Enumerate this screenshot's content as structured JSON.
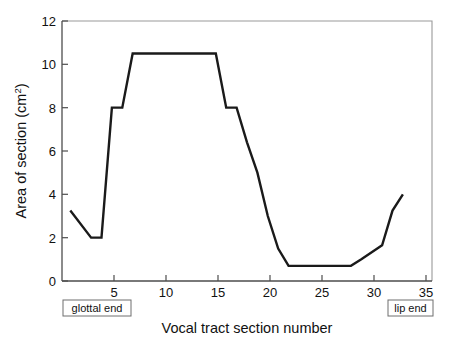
{
  "chart_data": {
    "type": "line",
    "title": "",
    "xlabel": "Vocal tract section number",
    "ylabel": "Area of section (cm",
    "ylabel_superscript": "2",
    "ylabel_suffix": ")",
    "xlim": [
      0.2,
      35.8
    ],
    "ylim": [
      0,
      12
    ],
    "xticks": [
      5,
      10,
      15,
      20,
      25,
      30,
      35
    ],
    "xtick_labels": [
      "5",
      "10",
      "15",
      "20",
      "25",
      "30",
      "35"
    ],
    "yticks": [
      0,
      2,
      4,
      6,
      8,
      10,
      12
    ],
    "ytick_labels": [
      "0",
      "2",
      "4",
      "6",
      "8",
      "10",
      "12"
    ],
    "grid": false,
    "legend": null,
    "series": [
      {
        "name": "area function",
        "color": "#1a1a1a",
        "x": [
          1,
          3,
          4,
          5,
          6,
          7,
          15,
          16,
          17,
          18,
          19,
          20,
          21,
          22,
          28,
          29,
          31,
          32,
          33
        ],
        "values": [
          3.25,
          2.0,
          2.0,
          8.0,
          8.0,
          10.5,
          10.5,
          8.0,
          8.0,
          6.4,
          5.0,
          3.0,
          1.5,
          0.7,
          0.7,
          1.0,
          1.65,
          3.25,
          4.0
        ]
      }
    ],
    "annotations": [
      {
        "name": "glottal-end",
        "text": "glottal end",
        "x_position": "left",
        "boxed": true
      },
      {
        "name": "lip-end",
        "text": "lip end",
        "x_position": "right",
        "boxed": true
      }
    ]
  },
  "colors": {
    "line": "#1a1a1a",
    "axis": "#4d4d4d",
    "frame": "#9a9a9a",
    "background": "#ffffff",
    "box_border": "#6e6e6e"
  }
}
